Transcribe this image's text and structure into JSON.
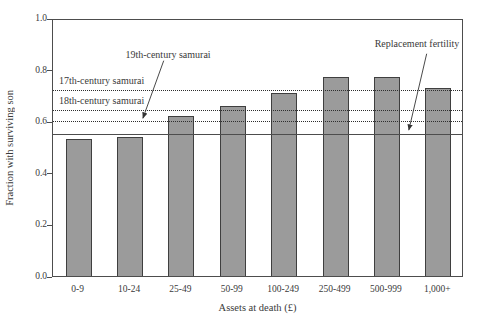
{
  "page": {
    "background": "#ffffff",
    "text_color": "#3a3a3a"
  },
  "chart_data": {
    "type": "bar",
    "title": "",
    "xlabel": "Assets at death (£)",
    "ylabel": "Fraction with surviving son",
    "categories": [
      "0-9",
      "10-24",
      "25-49",
      "50-99",
      "100-249",
      "250-499",
      "500-999",
      "1,000+"
    ],
    "values": [
      0.53,
      0.54,
      0.62,
      0.66,
      0.71,
      0.77,
      0.77,
      0.73
    ],
    "ylim": [
      0.0,
      1.0
    ],
    "yticks": [
      {
        "value": 0.0,
        "label": "0.0"
      },
      {
        "value": 0.2,
        "label": "0.2"
      },
      {
        "value": 0.4,
        "label": "0.4"
      },
      {
        "value": 0.6,
        "label": "0.6"
      },
      {
        "value": 0.8,
        "label": "0.8"
      },
      {
        "value": 1.0,
        "label": "1.0"
      }
    ],
    "grid": "off",
    "legend": "none",
    "bar_color": "#9b9b9b",
    "bar_border_color": "#3f3f3f",
    "frame_color": "#4d4d4d",
    "reference_lines": [
      {
        "label": "17th-century samurai",
        "value": 0.73,
        "style": "dotted",
        "label_mode": "above-left"
      },
      {
        "label": "18th-century samurai",
        "value": 0.65,
        "style": "dotted",
        "label_mode": "above-left"
      },
      {
        "label": "19th-century samurai",
        "value": 0.61,
        "style": "dotted",
        "label_mode": "arrow"
      },
      {
        "label": "Replacement fertility",
        "value": 0.56,
        "style": "solid",
        "label_mode": "arrow"
      }
    ]
  }
}
